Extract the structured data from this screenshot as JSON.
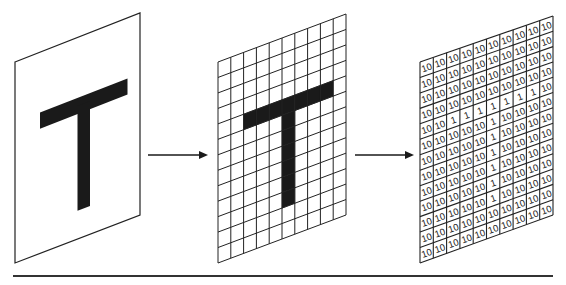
{
  "diagram": {
    "colors": {
      "ink": "#1a1a1a",
      "paper": "#ffffff",
      "grid_line": "#222222",
      "baseline": "#333333"
    },
    "panels": [
      {
        "id": "image",
        "label": "T",
        "corners": {
          "tl": [
            15,
            62
          ],
          "tr": [
            140,
            13
          ],
          "br": [
            140,
            215
          ],
          "bl": [
            15,
            263
          ]
        }
      },
      {
        "id": "pixel-grid",
        "cols": 10,
        "rows": 13,
        "corners": {
          "tl": [
            218,
            62
          ],
          "tr": [
            346,
            14
          ],
          "br": [
            346,
            215
          ],
          "bl": [
            218,
            263
          ]
        }
      },
      {
        "id": "numeric-grid",
        "cols": 10,
        "rows": 13,
        "corners": {
          "tl": [
            420,
            62
          ],
          "tr": [
            553,
            16
          ],
          "br": [
            553,
            215
          ],
          "bl": [
            420,
            263
          ]
        }
      }
    ],
    "arrows": [
      {
        "from": [
          148,
          155
        ],
        "to": [
          208,
          155
        ]
      },
      {
        "from": [
          355,
          155
        ],
        "to": [
          414,
          155
        ]
      }
    ],
    "baseline": {
      "x1": 13,
      "x2": 553,
      "y": 276
    },
    "values": {
      "background": "10",
      "foreground": "1"
    },
    "matrix": [
      [
        0,
        0,
        0,
        0,
        0,
        0,
        0,
        0,
        0,
        0
      ],
      [
        0,
        0,
        0,
        0,
        0,
        0,
        0,
        0,
        0,
        0
      ],
      [
        0,
        0,
        0,
        0,
        0,
        0,
        0,
        0,
        0,
        0
      ],
      [
        0,
        0,
        0,
        0,
        0,
        0,
        0,
        0,
        0,
        0
      ],
      [
        0,
        0,
        1,
        1,
        1,
        1,
        1,
        1,
        1,
        0
      ],
      [
        0,
        0,
        0,
        0,
        0,
        1,
        0,
        0,
        0,
        0
      ],
      [
        0,
        0,
        0,
        0,
        0,
        1,
        0,
        0,
        0,
        0
      ],
      [
        0,
        0,
        0,
        0,
        0,
        1,
        0,
        0,
        0,
        0
      ],
      [
        0,
        0,
        0,
        0,
        0,
        1,
        0,
        0,
        0,
        0
      ],
      [
        0,
        0,
        0,
        0,
        0,
        1,
        0,
        0,
        0,
        0
      ],
      [
        0,
        0,
        0,
        0,
        0,
        1,
        0,
        0,
        0,
        0
      ],
      [
        0,
        0,
        0,
        0,
        0,
        0,
        0,
        0,
        0,
        0
      ],
      [
        0,
        0,
        0,
        0,
        0,
        0,
        0,
        0,
        0,
        0
      ]
    ]
  }
}
